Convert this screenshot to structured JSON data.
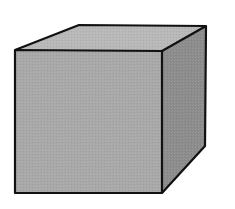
{
  "diagram": {
    "type": "3d-cube",
    "colors": {
      "background": "#ffffff",
      "front_face": "#a8a8a8",
      "top_face": "#b8b8b8",
      "right_face": "#8c8c8c",
      "outline": "#111111"
    },
    "vertices": {
      "front_top_left": [
        15,
        50
      ],
      "front_top_right": [
        162,
        51
      ],
      "front_bottom_right": [
        162,
        193
      ],
      "front_bottom_left": [
        15,
        193
      ],
      "back_top_left": [
        79,
        25
      ],
      "back_top_right": [
        206,
        26
      ],
      "back_bottom_right": [
        205,
        146
      ]
    }
  }
}
